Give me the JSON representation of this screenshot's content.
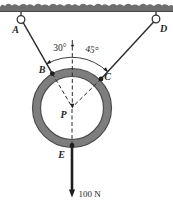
{
  "figure": {
    "points": {
      "a": "A",
      "b": "B",
      "c": "C",
      "d": "D",
      "p": "P",
      "e": "E"
    },
    "angles": {
      "left": "30°",
      "right": "45°"
    },
    "force": {
      "label": "100 N"
    },
    "colors": {
      "background": "#ffffff",
      "ceiling": "#6e6e6e",
      "ceiling_edge": "#474747",
      "ring_band": "#7e7e7e",
      "ring_edge": "#4d4d4d",
      "line": "#1e1e1e"
    }
  }
}
